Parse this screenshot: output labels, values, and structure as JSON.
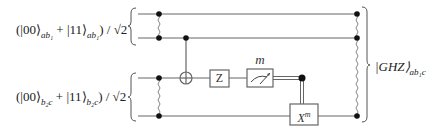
{
  "inputs": [
    {
      "ket_a": "|00⟩",
      "sub_a": "ab₁",
      "plus": " + ",
      "ket_b": "|11⟩",
      "sub_b": "ab₁",
      "norm": ") / √2",
      "open": "("
    },
    {
      "ket_a": "|00⟩",
      "sub_a": "b₂c",
      "plus": " + ",
      "ket_b": "|11⟩",
      "sub_b": "b₂c",
      "norm": ") / √2",
      "open": "("
    }
  ],
  "gates": {
    "z": "Z",
    "measure_label": "m",
    "x_base": "X",
    "x_sup": "m"
  },
  "output": {
    "ket": "|GHZ⟩",
    "sub": "ab₁c"
  },
  "colors": {
    "wire": "#555555",
    "dot": "#111111",
    "box_border": "#555555"
  }
}
